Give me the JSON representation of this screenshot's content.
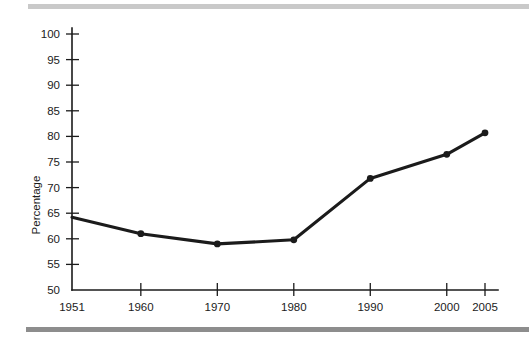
{
  "chart_data": {
    "type": "line",
    "title": "",
    "xlabel": "",
    "ylabel": "Percentage",
    "x": [
      1951,
      1960,
      1970,
      1980,
      1990,
      2000,
      2005
    ],
    "categories": [
      "1951",
      "1960",
      "1970",
      "1980",
      "1990",
      "2000",
      "2005"
    ],
    "values": [
      64.2,
      61.0,
      59.0,
      59.8,
      71.8,
      76.5,
      80.7
    ],
    "series": [
      {
        "name": "Percentage",
        "values": [
          64.2,
          61.0,
          59.0,
          59.8,
          71.8,
          76.5,
          80.7
        ]
      }
    ],
    "ylim": [
      50,
      100
    ],
    "xlim": [
      1951,
      2005
    ],
    "yticks": [
      50,
      55,
      60,
      65,
      70,
      75,
      80,
      85,
      90,
      95,
      100
    ],
    "ytick_labels": [
      "50",
      "55",
      "60",
      "65",
      "70",
      "75",
      "80",
      "85",
      "90",
      "95",
      "100"
    ],
    "xticks": [
      1951,
      1960,
      1970,
      1980,
      1990,
      2000,
      2005
    ],
    "xtick_labels": [
      "1951",
      "1960",
      "1970",
      "1980",
      "1990",
      "2000",
      "2005"
    ],
    "grid": false,
    "legend": false,
    "legend_position": "none",
    "marker": "circle",
    "markers_shown_at": [
      1960,
      1970,
      1980,
      1990,
      2000,
      2005
    ],
    "line_color": "#1b1b1b",
    "marker_color": "#1b1b1b",
    "background_color": "#ffffff"
  },
  "decorations": {
    "top_rule_color": "#c9c9c9",
    "bottom_rule_color": "#8d8d8d"
  }
}
